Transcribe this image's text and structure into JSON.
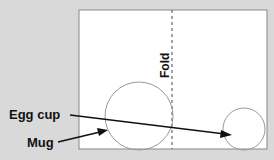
{
  "labels": {
    "fold": "Fold",
    "egg_cup": "Egg cup",
    "mug": "Mug"
  },
  "colors": {
    "background": "#d9d9d9",
    "paper": "#ffffff",
    "line": "#888888",
    "text": "#111111"
  }
}
